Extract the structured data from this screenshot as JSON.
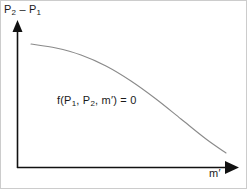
{
  "figure": {
    "name": "phase-boundary-curve",
    "background_color": "#ffffff",
    "border_color": "#cccccc"
  },
  "axes": {
    "color": "#111111",
    "origin": {
      "x": 16,
      "y": 167
    },
    "y_axis": {
      "label_parts": {
        "p2": "P",
        "p2_sub": "2",
        "minus": " – ",
        "p1": "P",
        "p1_sub": "1"
      },
      "label_text": "P2 – P1",
      "top": 20,
      "arrow": "up"
    },
    "x_axis": {
      "label_parts": {
        "m": "m",
        "prime": "′"
      },
      "label_text": "m′",
      "right": 238,
      "arrow": "right"
    }
  },
  "annotation": {
    "equation_parts": {
      "f_open": "f(P",
      "sub1": "1",
      "comma1": ", P",
      "sub2": "2",
      "comma2": ", m",
      "prime": "′",
      "close": ") = 0"
    },
    "equation_text": "f(P1, P2, m′) = 0"
  },
  "chart_data": {
    "type": "line",
    "title": "",
    "xlabel": "m′",
    "ylabel": "P2 – P1",
    "grid": false,
    "legend": null,
    "curve_color": "#8a8a8a",
    "curve_width": 1,
    "annotations": [
      "f(P1, P2, m′) = 0"
    ],
    "points_px": [
      {
        "x": 30,
        "y": 43
      },
      {
        "x": 55,
        "y": 47
      },
      {
        "x": 80,
        "y": 54
      },
      {
        "x": 105,
        "y": 65
      },
      {
        "x": 130,
        "y": 80
      },
      {
        "x": 155,
        "y": 98
      },
      {
        "x": 180,
        "y": 118
      },
      {
        "x": 205,
        "y": 138
      },
      {
        "x": 225,
        "y": 152
      }
    ]
  }
}
